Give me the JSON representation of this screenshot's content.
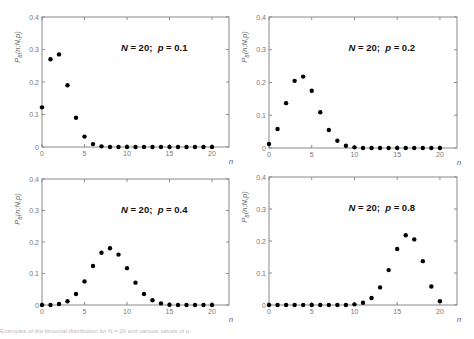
{
  "figure": {
    "caption": "Examples of the binomial distribution for N = 20 and various values of p."
  },
  "chart_data": [
    {
      "type": "scatter",
      "title": "N = 20;  p = 0.1",
      "N_label": "N",
      "p_label": "p",
      "N": 20,
      "p": 0.1,
      "xlabel": "n",
      "ylabel": "P_B(n;N,p)",
      "xlim": [
        0,
        22
      ],
      "ylim": [
        0,
        0.4
      ],
      "xticks": [
        0,
        5,
        10,
        15,
        20
      ],
      "yticks": [
        0,
        0.1,
        0.2,
        0.3,
        0.4
      ],
      "ytick_labels": [
        "0",
        "0.1",
        "0.2",
        "0.3",
        "0.4"
      ],
      "grid": false,
      "x": [
        0,
        1,
        2,
        3,
        4,
        5,
        6,
        7,
        8,
        9,
        10,
        11,
        12,
        13,
        14,
        15,
        16,
        17,
        18,
        19,
        20
      ],
      "values": [
        0.122,
        0.27,
        0.285,
        0.19,
        0.09,
        0.032,
        0.009,
        0.002,
        0.0,
        0.0,
        0.0,
        0.0,
        0.0,
        0.0,
        0.0,
        0.0,
        0.0,
        0.0,
        0.0,
        0.0,
        0.0
      ]
    },
    {
      "type": "scatter",
      "title": "N = 20;  p = 0.2",
      "N_label": "N",
      "p_label": "p",
      "N": 20,
      "p": 0.2,
      "xlabel": "n",
      "ylabel": "P_B(n;N,p)",
      "xlim": [
        0,
        22
      ],
      "ylim": [
        0,
        0.4
      ],
      "xticks": [
        0,
        5,
        10,
        15,
        20
      ],
      "yticks": [
        0,
        0.1,
        0.2,
        0.3,
        0.4
      ],
      "ytick_labels": [
        "0",
        "0.1",
        "0.2",
        "0.3",
        "0.4"
      ],
      "grid": false,
      "x": [
        0,
        1,
        2,
        3,
        4,
        5,
        6,
        7,
        8,
        9,
        10,
        11,
        12,
        13,
        14,
        15,
        16,
        17,
        18,
        19,
        20
      ],
      "values": [
        0.012,
        0.058,
        0.137,
        0.205,
        0.218,
        0.175,
        0.109,
        0.055,
        0.022,
        0.007,
        0.002,
        0.0,
        0.0,
        0.0,
        0.0,
        0.0,
        0.0,
        0.0,
        0.0,
        0.0,
        0.0
      ]
    },
    {
      "type": "scatter",
      "title": "N = 20;  p = 0.4",
      "N_label": "N",
      "p_label": "p",
      "N": 20,
      "p": 0.4,
      "xlabel": "n",
      "ylabel": "P_B(n;N,p)",
      "xlim": [
        0,
        22
      ],
      "ylim": [
        0,
        0.4
      ],
      "xticks": [
        0,
        5,
        10,
        15,
        20
      ],
      "yticks": [
        0,
        0.1,
        0.2,
        0.3,
        0.4
      ],
      "ytick_labels": [
        "0",
        "0.1",
        "0.2",
        "0.3",
        "0.4"
      ],
      "grid": false,
      "x": [
        0,
        1,
        2,
        3,
        4,
        5,
        6,
        7,
        8,
        9,
        10,
        11,
        12,
        13,
        14,
        15,
        16,
        17,
        18,
        19,
        20
      ],
      "values": [
        0.0,
        0.0,
        0.003,
        0.012,
        0.035,
        0.075,
        0.124,
        0.166,
        0.18,
        0.16,
        0.117,
        0.071,
        0.035,
        0.015,
        0.005,
        0.001,
        0.0,
        0.0,
        0.0,
        0.0,
        0.0
      ]
    },
    {
      "type": "scatter",
      "title": "N = 20;  p = 0.8",
      "N_label": "N",
      "p_label": "p",
      "N": 20,
      "p": 0.8,
      "xlabel": "n",
      "ylabel": "P_B(n;N,p)",
      "xlim": [
        0,
        22
      ],
      "ylim": [
        0,
        0.4
      ],
      "xticks": [
        0,
        5,
        10,
        15,
        20
      ],
      "yticks": [
        0,
        0.1,
        0.2,
        0.3,
        0.4
      ],
      "ytick_labels": [
        "0",
        "0.1",
        "0.2",
        "0.3",
        "0.4"
      ],
      "grid": false,
      "x": [
        0,
        1,
        2,
        3,
        4,
        5,
        6,
        7,
        8,
        9,
        10,
        11,
        12,
        13,
        14,
        15,
        16,
        17,
        18,
        19,
        20
      ],
      "values": [
        0.0,
        0.0,
        0.0,
        0.0,
        0.0,
        0.0,
        0.0,
        0.0,
        0.0,
        0.0,
        0.002,
        0.007,
        0.022,
        0.055,
        0.109,
        0.175,
        0.218,
        0.205,
        0.137,
        0.058,
        0.012
      ]
    }
  ]
}
